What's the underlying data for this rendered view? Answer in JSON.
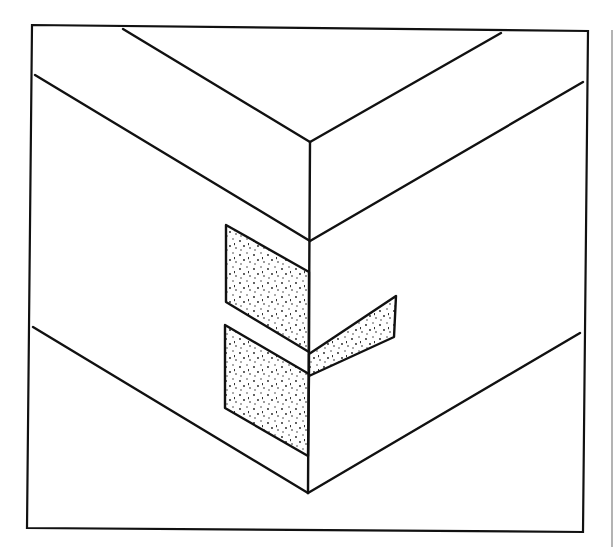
{
  "figure": {
    "stroke_color": "#111111",
    "fill_color": "#ffffff",
    "stipple_color": "#1a1a1a",
    "edge_line_color": "#9a9a9a",
    "frame": {
      "points": "32,25 588,31 583,532 27,528"
    },
    "edges": [
      {
        "name": "top-left-back-edge",
        "x1": 123,
        "y1": 29,
        "x2": 310,
        "y2": 142
      },
      {
        "name": "top-right-back-edge",
        "x1": 501,
        "y1": 33,
        "x2": 310,
        "y2": 142
      },
      {
        "name": "upper-left-edge",
        "x1": 35,
        "y1": 75,
        "x2": 310,
        "y2": 241
      },
      {
        "name": "upper-right-edge",
        "x1": 583,
        "y1": 82,
        "x2": 310,
        "y2": 241
      },
      {
        "name": "corner-vertical-edge",
        "x1": 310,
        "y1": 142,
        "x2": 308,
        "y2": 493
      },
      {
        "name": "lower-left-edge",
        "x1": 33,
        "y1": 327,
        "x2": 308,
        "y2": 493
      },
      {
        "name": "lower-right-edge",
        "x1": 580,
        "y1": 333,
        "x2": 308,
        "y2": 493
      }
    ],
    "tenons": [
      {
        "name": "upper-left-tenon",
        "points": "226,225 309,272 309,352 226,302"
      },
      {
        "name": "lower-left-tenon",
        "points": "225,325 309,374 308,456 225,408"
      },
      {
        "name": "right-wedge-tenon",
        "points": "309,354 396,296 394,337 309,376"
      }
    ],
    "caption_fragment": ""
  }
}
